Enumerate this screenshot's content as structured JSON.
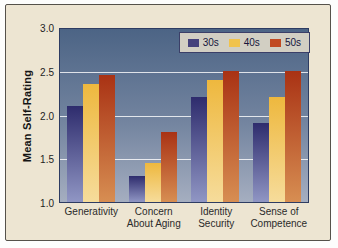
{
  "figure": {
    "page_background": "#fdfdfc",
    "panel_background": "#ede5d2",
    "panel_border_color": "#55514a"
  },
  "chart_data": {
    "type": "bar",
    "title": "",
    "xlabel": "",
    "ylabel": "Mean Self-Rating",
    "ylim": [
      1.0,
      3.0
    ],
    "yticks": [
      3.0,
      2.5,
      2.0,
      1.5,
      1.0
    ],
    "ytick_labels": [
      "3.0",
      "2.5",
      "2.0",
      "1.5",
      "1.0"
    ],
    "grid": "horizontal",
    "gridline_values": [
      2.5,
      2.0,
      1.5
    ],
    "legend_position": "top-right",
    "plot_bg_top": "#4c6485",
    "plot_bg_bottom": "#a5aec0",
    "plot_border_color": "#2e3c62",
    "categories": [
      "Generativity",
      "Concern\nAbout Aging",
      "Identity\nSecurity",
      "Sense of\nCompetence"
    ],
    "series": [
      {
        "name": "30s",
        "values": [
          2.1,
          1.3,
          2.2,
          1.9
        ],
        "color_top": "#2e2c6d",
        "color_bottom": "#9096c4",
        "legend_color": "#45427c"
      },
      {
        "name": "40s",
        "values": [
          2.35,
          1.45,
          2.4,
          2.2
        ],
        "color_top": "#eeb83e",
        "color_bottom": "#f6dc9b",
        "legend_color": "#f1c34c"
      },
      {
        "name": "50s",
        "values": [
          2.45,
          1.8,
          2.5,
          2.5
        ],
        "color_top": "#a93214",
        "color_bottom": "#d78e52",
        "legend_color": "#c14a22"
      }
    ]
  }
}
